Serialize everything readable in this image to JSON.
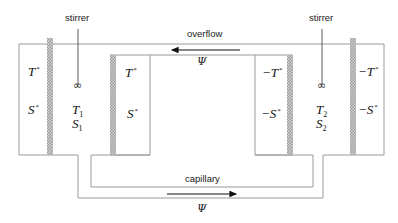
{
  "labels": {
    "stirrer_left": "stirrer",
    "stirrer_right": "stirrer",
    "overflow": "overflow",
    "capillary": "capillary",
    "psi_top": "Ψ",
    "psi_bottom": "Ψ",
    "stirrer_symbol": "∞"
  },
  "left_outer": {
    "T": "T",
    "T_sup": "*",
    "S": "S",
    "S_sup": "*"
  },
  "left_inner": {
    "T": "T",
    "T_sup": "*",
    "S": "S",
    "S_sup": "*"
  },
  "right_inner": {
    "T": "−T",
    "T_sup": "*",
    "S": "−S",
    "S_sup": "*"
  },
  "right_outer": {
    "T": "−T",
    "T_sup": "*",
    "S": "−S",
    "S_sup": "*"
  },
  "vessel_1": {
    "T": "T",
    "T_sub": "1",
    "S": "S",
    "S_sub": "1"
  },
  "vessel_2": {
    "T": "T",
    "T_sub": "2",
    "S": "S",
    "S_sub": "2"
  },
  "colors": {
    "line": "#9a9a9a",
    "membrane": "#b8b8b8",
    "arrow": "#111111"
  }
}
